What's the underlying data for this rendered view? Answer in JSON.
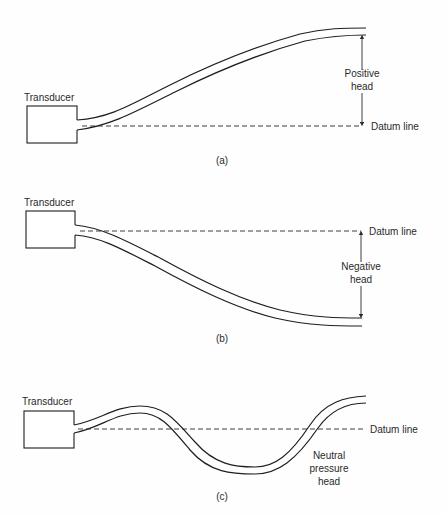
{
  "figure": {
    "panels": [
      {
        "id": "a",
        "caption": "(a)",
        "transducer_label": "Transducer",
        "datum_label": "Datum line",
        "head_label_line1": "Positive",
        "head_label_line2": "head",
        "head_type": "positive"
      },
      {
        "id": "b",
        "caption": "(b)",
        "transducer_label": "Transducer",
        "datum_label": "Datum line",
        "head_label_line1": "Negative",
        "head_label_line2": "head",
        "head_type": "negative"
      },
      {
        "id": "c",
        "caption": "(c)",
        "transducer_label": "Transducer",
        "datum_label": "Datum line",
        "head_label_line1": "Neutral",
        "head_label_line2": "pressure",
        "head_label_line3": "head",
        "head_type": "neutral"
      }
    ],
    "colors": {
      "ink": "#1e1e1e",
      "background": "#fefefe"
    }
  }
}
